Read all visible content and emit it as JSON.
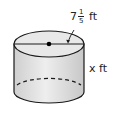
{
  "figure": {
    "shape": "cylinder",
    "diameter_label": {
      "whole": "7",
      "numerator": "1",
      "denominator": "5",
      "unit": "ft"
    },
    "height_label": "x ft",
    "colors": {
      "top_face": "#e6e6e6",
      "side": "#d3d3d3",
      "stroke": "#1a1a1a"
    }
  }
}
